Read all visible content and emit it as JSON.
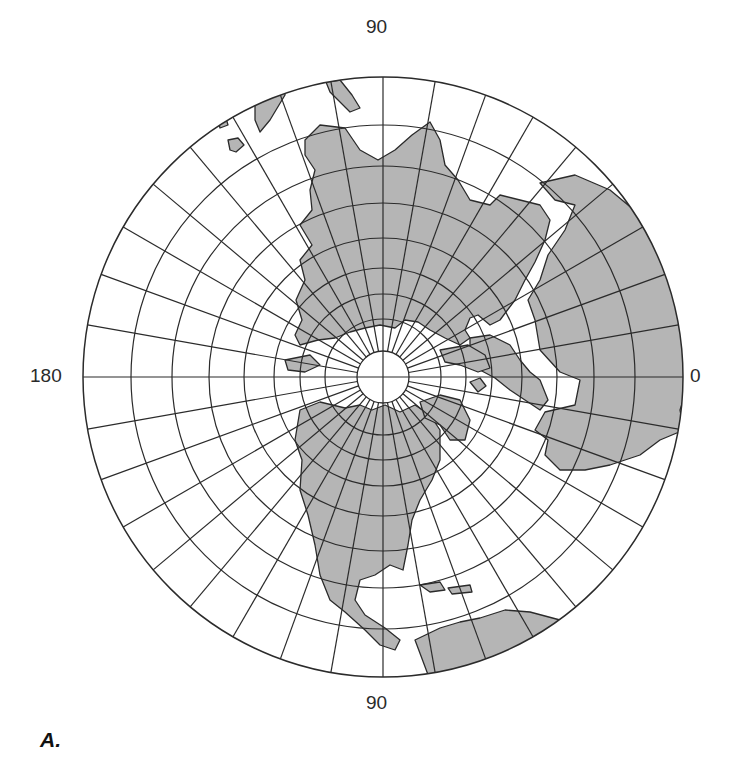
{
  "figure": {
    "panel_label": "A.",
    "projection": "polar azimuthal (north pole centered)",
    "labels": {
      "top": "90",
      "bottom": "90",
      "left": "180",
      "right": "0"
    },
    "colors": {
      "land": "#b5b5b5",
      "ocean": "#ffffff",
      "grid": "#2b2b2b"
    },
    "grid": {
      "center": [
        383,
        377
      ],
      "parallel_radii": [
        300,
        252,
        211,
        174,
        139,
        109,
        83,
        58
      ],
      "pole_disc_radius": 26,
      "meridian_count": 36,
      "meridian_spacing_deg": 10
    }
  }
}
